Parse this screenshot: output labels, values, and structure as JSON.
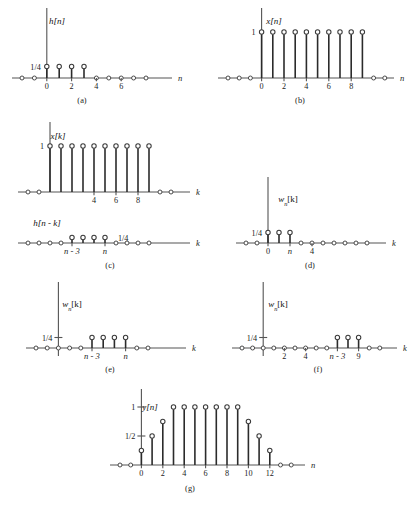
{
  "figure": {
    "axis_color": "#545454",
    "stem_color": "#2b2b2b",
    "marker_fill": "#ffffff",
    "background": "#ffffff"
  },
  "chart_data": [
    {
      "id": "a",
      "type": "stem",
      "title": "h[n]",
      "xlabel": "n",
      "ylabel": "",
      "caption": "(a)",
      "amplitude_labels": [
        "1/4"
      ],
      "amplitude_values": [
        0.25
      ],
      "tick_labels": [
        "0",
        "2",
        "4",
        "6"
      ],
      "tick_positions": [
        0,
        2,
        4,
        6
      ],
      "x": [
        -2,
        -1,
        0,
        1,
        2,
        3,
        4,
        5,
        6,
        7,
        8
      ],
      "values": [
        0,
        0,
        0.25,
        0.25,
        0.25,
        0.25,
        0,
        0,
        0,
        0,
        0
      ],
      "xlim": [
        -2.6,
        9.4
      ],
      "ylim": [
        0,
        1
      ],
      "grid": false,
      "legend": "none"
    },
    {
      "id": "b",
      "type": "stem",
      "title": "x[n]",
      "xlabel": "n",
      "ylabel": "",
      "caption": "(b)",
      "amplitude_labels": [
        "1"
      ],
      "amplitude_values": [
        1
      ],
      "tick_labels": [
        "0",
        "2",
        "4",
        "6",
        "8"
      ],
      "tick_positions": [
        0,
        2,
        4,
        6,
        8
      ],
      "x": [
        -3,
        -2,
        -1,
        0,
        1,
        2,
        3,
        4,
        5,
        6,
        7,
        8,
        9,
        10,
        11
      ],
      "values": [
        0,
        0,
        0,
        1,
        1,
        1,
        1,
        1,
        1,
        1,
        1,
        1,
        1,
        0,
        0
      ],
      "xlim": [
        -3.6,
        11.6
      ],
      "ylim": [
        0,
        1
      ],
      "grid": false,
      "legend": "none"
    },
    {
      "id": "c1",
      "type": "stem",
      "title": "x[k]",
      "xlabel": "k",
      "ylabel": "",
      "caption": "",
      "amplitude_labels": [
        "1"
      ],
      "amplitude_values": [
        1
      ],
      "tick_labels": [
        "4",
        "6",
        "8"
      ],
      "tick_positions": [
        4,
        6,
        8
      ],
      "x": [
        -2,
        -1,
        0,
        1,
        2,
        3,
        4,
        5,
        6,
        7,
        8,
        9,
        10,
        11
      ],
      "values": [
        0,
        0,
        1,
        1,
        1,
        1,
        1,
        1,
        1,
        1,
        1,
        1,
        0,
        0
      ],
      "xlim": [
        -2.8,
        12.2
      ],
      "ylim": [
        0,
        1
      ],
      "grid": false,
      "legend": "none"
    },
    {
      "id": "c2",
      "type": "stem",
      "title": "h[n - k]",
      "xlabel": "k",
      "ylabel": "",
      "caption": "(c)",
      "amplitude_labels": [
        "1/4"
      ],
      "amplitude_values": [
        0.25
      ],
      "tick_labels": [
        "n - 3",
        "n"
      ],
      "tick_positions": [
        4,
        7
      ],
      "x": [
        0,
        1,
        2,
        3,
        4,
        5,
        6,
        7,
        8,
        9,
        10,
        11
      ],
      "values": [
        0,
        0,
        0,
        0,
        0.25,
        0.25,
        0.25,
        0.25,
        0,
        0,
        0,
        0
      ],
      "xlim": [
        -0.8,
        12.2
      ],
      "ylim": [
        0,
        1
      ],
      "grid": false,
      "legend": "none"
    },
    {
      "id": "d",
      "type": "stem",
      "title": "w_n[k]",
      "xlabel": "k",
      "ylabel": "",
      "caption": "(d)",
      "amplitude_labels": [
        "1/4"
      ],
      "amplitude_values": [
        0.25
      ],
      "tick_labels": [
        "0",
        "n",
        "4"
      ],
      "tick_positions": [
        0,
        2,
        4
      ],
      "x": [
        -2,
        -1,
        0,
        1,
        2,
        3,
        4,
        5,
        6,
        7,
        8,
        9
      ],
      "values": [
        0,
        0,
        0.25,
        0.25,
        0.25,
        0,
        0,
        0,
        0,
        0,
        0,
        0
      ],
      "xlim": [
        -2.8,
        10.2
      ],
      "ylim": [
        0,
        1
      ],
      "grid": false,
      "legend": "none"
    },
    {
      "id": "e",
      "type": "stem",
      "title": "w_n[k]",
      "xlabel": "k",
      "ylabel": "",
      "caption": "(e)",
      "amplitude_labels": [
        "1/4"
      ],
      "amplitude_values": [
        0.25
      ],
      "tick_labels": [
        "n - 3",
        "n"
      ],
      "tick_positions": [
        3,
        6
      ],
      "x": [
        -2,
        -1,
        0,
        1,
        2,
        3,
        4,
        5,
        6,
        7,
        8
      ],
      "values": [
        0,
        0,
        0,
        0,
        0,
        0.25,
        0.25,
        0.25,
        0.25,
        0,
        0
      ],
      "xlim": [
        -2.8,
        9.0
      ],
      "ylim": [
        0,
        1
      ],
      "grid": false,
      "legend": "none"
    },
    {
      "id": "f",
      "type": "stem",
      "title": "w_n[k]",
      "xlabel": "k",
      "ylabel": "",
      "caption": "(f)",
      "amplitude_labels": [
        "1/4"
      ],
      "amplitude_values": [
        0.25
      ],
      "tick_labels": [
        "2",
        "4",
        "n - 3",
        "9"
      ],
      "tick_positions": [
        2,
        4,
        7,
        9
      ],
      "x": [
        -2,
        -1,
        0,
        1,
        2,
        3,
        4,
        5,
        6,
        7,
        8,
        9,
        10,
        11
      ],
      "values": [
        0,
        0,
        0,
        0,
        0,
        0,
        0,
        0,
        0,
        0.25,
        0.25,
        0.25,
        0,
        0
      ],
      "xlim": [
        -2.8,
        12.2
      ],
      "ylim": [
        0,
        1
      ],
      "grid": false,
      "legend": "none"
    },
    {
      "id": "g",
      "type": "stem",
      "title": "y[n]",
      "xlabel": "n",
      "ylabel": "",
      "caption": "(g)",
      "amplitude_labels": [
        "1",
        "1/2"
      ],
      "amplitude_values": [
        1,
        0.5
      ],
      "tick_labels": [
        "0",
        "2",
        "4",
        "6",
        "8",
        "10",
        "12"
      ],
      "tick_positions": [
        0,
        2,
        4,
        6,
        8,
        10,
        12
      ],
      "x": [
        -2,
        -1,
        0,
        1,
        2,
        3,
        4,
        5,
        6,
        7,
        8,
        9,
        10,
        11,
        12,
        13,
        14
      ],
      "values": [
        0,
        0,
        0.25,
        0.5,
        0.75,
        1,
        1,
        1,
        1,
        1,
        1,
        1,
        0.75,
        0.5,
        0.25,
        0,
        0
      ],
      "xlim": [
        -2.8,
        15.0
      ],
      "ylim": [
        0,
        1
      ],
      "grid": false,
      "legend": "none"
    }
  ]
}
